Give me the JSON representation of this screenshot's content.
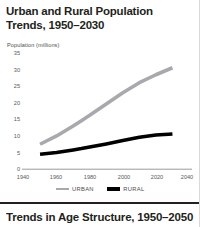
{
  "figure": {
    "title": "Urban and Rural Population Trends, 1950–2030",
    "axis_caption": "Population (millions)"
  },
  "legend": {
    "urban_label": "URBAN",
    "rural_label": "RURAL",
    "urban_color": "#a7a9ac",
    "rural_color": "#000000"
  },
  "next_section": {
    "title": "Trends in Age Structure, 1950–2050"
  },
  "chart_data": {
    "type": "line",
    "title": "Urban and Rural Population Trends, 1950–2030",
    "xlabel": "",
    "ylabel": "Population (millions)",
    "xlim": [
      1940,
      2040
    ],
    "ylim": [
      0,
      35
    ],
    "grid": false,
    "legend_position": "bottom-center",
    "xticks": [
      1940,
      1960,
      1980,
      2000,
      2020,
      2040
    ],
    "yticks": [
      0,
      5,
      10,
      15,
      20,
      25,
      30,
      35
    ],
    "x": [
      1950,
      1960,
      1970,
      1975,
      1980,
      1990,
      2000,
      2010,
      2020,
      2030
    ],
    "series": [
      {
        "name": "URBAN",
        "color": "#a7a9ac",
        "values": [
          7.5,
          10.0,
          13.0,
          14.6,
          16.2,
          19.6,
          23.0,
          26.0,
          28.4,
          30.5
        ]
      },
      {
        "name": "RURAL",
        "color": "#000000",
        "values": [
          4.5,
          5.0,
          5.8,
          6.2,
          6.7,
          7.6,
          8.6,
          9.6,
          10.3,
          10.6
        ]
      }
    ]
  }
}
